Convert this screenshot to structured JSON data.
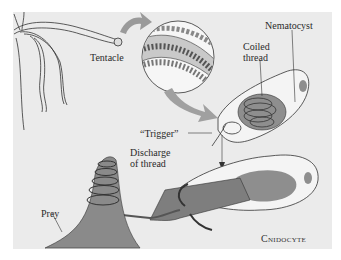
{
  "figure": {
    "background": "#ebebeb",
    "caption": "Cnidocyte",
    "labels": {
      "tentacle": "Tentacle",
      "nematocyst": "Nematocyst",
      "coiled_thread_1": "Coiled",
      "coiled_thread_2": "thread",
      "trigger": "“Trigger”",
      "discharge_1": "Discharge",
      "discharge_2": "of thread",
      "prey": "Prey"
    },
    "colors": {
      "cell_fill": "#f4f4f4",
      "capsule_fill": "#8e8e8e",
      "arrow_fill": "#9a9a9a",
      "outline": "#333333"
    }
  }
}
